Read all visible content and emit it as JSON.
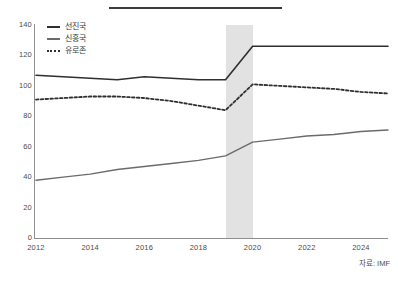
{
  "source_note": "자료: IMF",
  "legend": {
    "items": [
      {
        "label": "선진국",
        "style": "solid-thick",
        "color": "#2f2f2f"
      },
      {
        "label": "신흥국",
        "style": "solid-thin",
        "color": "#6b6b6b"
      },
      {
        "label": "유로존",
        "style": "dotted",
        "color": "#2f2f2f"
      }
    ]
  },
  "shaded_band": {
    "from": 2019,
    "to": 2020,
    "color": "#e2e2e2"
  },
  "chart_data": {
    "type": "line",
    "title": "",
    "subtitle": "",
    "xlabel": "",
    "ylabel": "",
    "xlim": [
      2012,
      2025
    ],
    "ylim": [
      0,
      140
    ],
    "grid": false,
    "legend_position": "top-left",
    "xticks": [
      2012,
      2014,
      2016,
      2018,
      2020,
      2022,
      2024
    ],
    "yticks": [
      0,
      20,
      40,
      60,
      80,
      100,
      120,
      140
    ],
    "x": [
      2012,
      2013,
      2014,
      2015,
      2016,
      2017,
      2018,
      2019,
      2020,
      2021,
      2022,
      2023,
      2024,
      2025
    ],
    "series": [
      {
        "name": "선진국",
        "color": "#2f2f2f",
        "style": "solid-thick",
        "values": [
          107,
          106,
          105,
          104,
          106,
          105,
          104,
          104,
          126,
          126,
          126,
          126,
          126,
          126
        ]
      },
      {
        "name": "신흥국",
        "color": "#6b6b6b",
        "style": "solid-thin",
        "values": [
          38,
          40,
          42,
          45,
          47,
          49,
          51,
          54,
          63,
          65,
          67,
          68,
          70,
          71
        ]
      },
      {
        "name": "유로존",
        "color": "#2f2f2f",
        "style": "dotted",
        "values": [
          91,
          92,
          93,
          93,
          92,
          90,
          87,
          84,
          101,
          100,
          99,
          98,
          96,
          95
        ]
      }
    ],
    "annotations": [
      {
        "type": "vspan",
        "from": 2019,
        "to": 2020,
        "color": "#e2e2e2"
      }
    ]
  }
}
